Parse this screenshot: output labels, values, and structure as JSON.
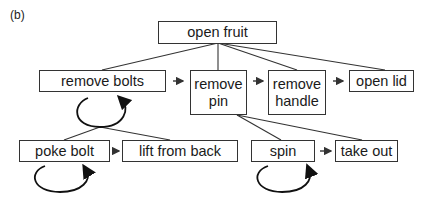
{
  "panel_label": "(b)",
  "nodes": {
    "root": "open fruit",
    "remove_bolts": "remove bolts",
    "remove_pin_l1": "remove",
    "remove_pin_l2": "pin",
    "remove_handle_l1": "remove",
    "remove_handle_l2": "handle",
    "open_lid": "open lid",
    "poke_bolt": "poke bolt",
    "lift_from_back": "lift from back",
    "spin": "spin",
    "take_out": "take out"
  },
  "edges": [
    {
      "from": "open fruit",
      "to": "remove bolts",
      "type": "hierarchy"
    },
    {
      "from": "open fruit",
      "to": "remove pin",
      "type": "hierarchy"
    },
    {
      "from": "open fruit",
      "to": "remove handle",
      "type": "hierarchy"
    },
    {
      "from": "open fruit",
      "to": "open lid",
      "type": "hierarchy"
    },
    {
      "from": "remove bolts",
      "to": "poke bolt",
      "type": "hierarchy"
    },
    {
      "from": "remove bolts",
      "to": "lift from back",
      "type": "hierarchy"
    },
    {
      "from": "remove pin",
      "to": "spin",
      "type": "hierarchy"
    },
    {
      "from": "remove pin",
      "to": "take out",
      "type": "hierarchy"
    },
    {
      "from": "remove bolts",
      "to": "remove pin",
      "type": "sequence"
    },
    {
      "from": "remove pin",
      "to": "remove handle",
      "type": "sequence"
    },
    {
      "from": "remove handle",
      "to": "open lid",
      "type": "sequence"
    },
    {
      "from": "poke bolt",
      "to": "lift from back",
      "type": "sequence"
    },
    {
      "from": "spin",
      "to": "take out",
      "type": "sequence"
    }
  ],
  "loops": [
    "remove bolts",
    "poke bolt",
    "spin"
  ],
  "colors": {
    "line": "#333333",
    "text": "#1a1a1a",
    "background": "#ffffff"
  }
}
